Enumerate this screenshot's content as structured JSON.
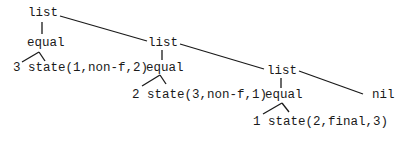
{
  "diagram": {
    "type": "tree",
    "nodes": {
      "root_list": "list",
      "equal_1": "equal",
      "equal_1_label": "3 state(1,non-f,2)",
      "list_2": "list",
      "equal_2": "equal",
      "equal_2_label": "2 state(3,non-f,1)",
      "list_3": "list",
      "equal_3": "equal",
      "equal_3_label": "1 state(2,final,3)",
      "nil": "nil"
    },
    "edges": [
      [
        "list",
        "equal"
      ],
      [
        "list",
        "list"
      ],
      [
        "equal",
        "3"
      ],
      [
        "equal",
        "state(1,non-f,2)"
      ],
      [
        "list",
        "equal"
      ],
      [
        "list",
        "list"
      ],
      [
        "equal",
        "2"
      ],
      [
        "equal",
        "state(3,non-f,1)"
      ],
      [
        "list",
        "equal"
      ],
      [
        "list",
        "nil"
      ],
      [
        "equal",
        "1"
      ],
      [
        "equal",
        "state(2,final,3)"
      ]
    ]
  }
}
